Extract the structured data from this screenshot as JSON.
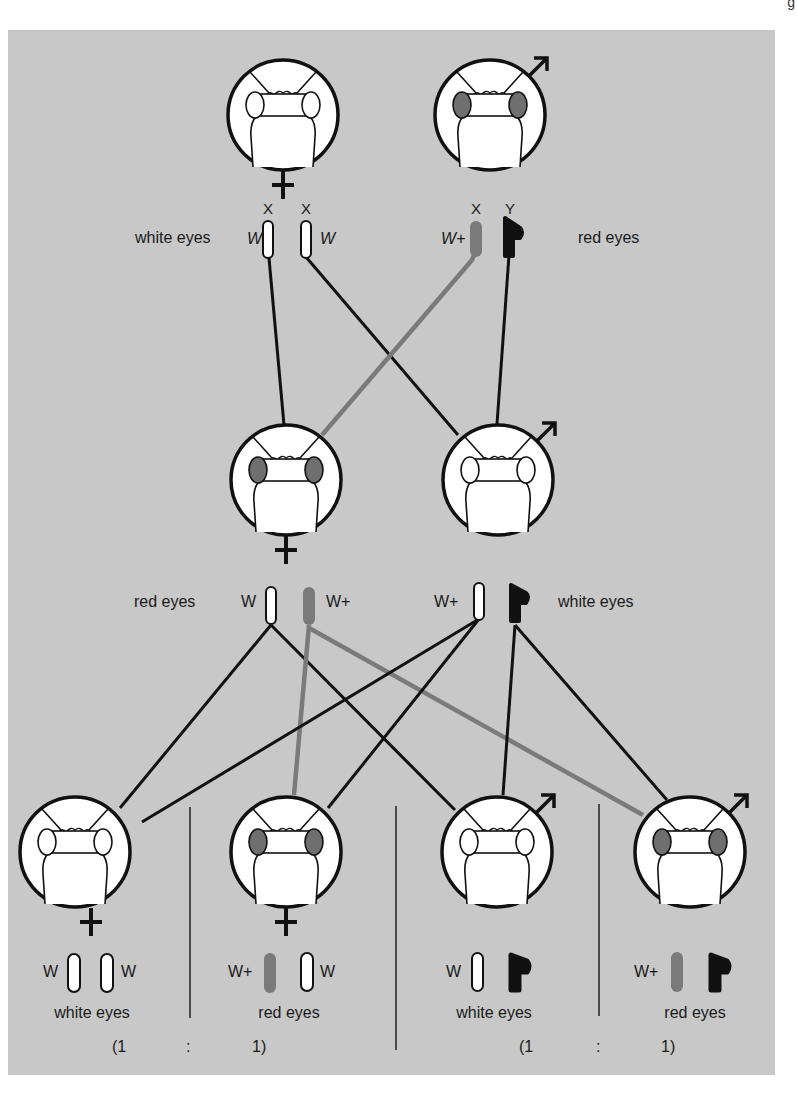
{
  "figure": {
    "colors": {
      "background": "#c8c8c8",
      "line_black": "#111111",
      "line_gray": "#7a7a7a",
      "red_eye": "#6f6f6f",
      "white": "#ffffff"
    }
  },
  "generation_1": {
    "female": {
      "sex_symbol": "♀",
      "eyes": "white",
      "chromosome_labels": [
        "X",
        "X"
      ],
      "alleles": [
        "W",
        "W"
      ],
      "phenotype_label": "white eyes"
    },
    "male": {
      "sex_symbol": "♂",
      "eyes": "red",
      "chromosome_labels": [
        "X",
        "Y"
      ],
      "alleles": [
        "W+",
        ""
      ],
      "phenotype_label": "red eyes"
    }
  },
  "generation_2": {
    "female": {
      "sex_symbol": "♀",
      "eyes": "red",
      "alleles": [
        "W",
        "W+"
      ],
      "phenotype_label": "red eyes"
    },
    "male": {
      "sex_symbol": "♂",
      "eyes": "white",
      "alleles": [
        "W+",
        ""
      ],
      "phenotype_label": "white eyes"
    }
  },
  "generation_3": [
    {
      "sex_symbol": "♀",
      "eyes": "white",
      "alleles": [
        "W",
        "W"
      ],
      "phenotype_label": "white eyes",
      "ratio_text": "(1"
    },
    {
      "sex_symbol": "♀",
      "eyes": "red",
      "alleles": [
        "W+",
        "W"
      ],
      "phenotype_label": "red eyes",
      "ratio_text": "1)"
    },
    {
      "sex_symbol": "♂",
      "eyes": "white",
      "alleles": [
        "W",
        ""
      ],
      "phenotype_label": "white eyes",
      "ratio_text": "(1"
    },
    {
      "sex_symbol": "♂",
      "eyes": "red",
      "alleles": [
        "W+",
        ""
      ],
      "phenotype_label": "red eyes",
      "ratio_text": "1)"
    }
  ],
  "ratios": {
    "females_separator": ":",
    "males_separator": ":"
  },
  "corner_text": "g"
}
